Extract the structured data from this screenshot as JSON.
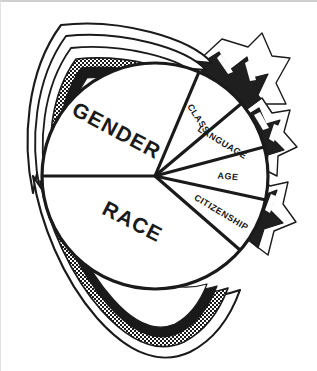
{
  "figure": {
    "name": "identity-wheel-lotus-diagram",
    "type": "segmented-circle",
    "background_color": "#ffffff",
    "ink_color": "#1a1a1a",
    "center": {
      "x": 155,
      "y": 176
    },
    "radius": 113
  },
  "segments": [
    {
      "id": "gender",
      "label": "GENDER",
      "size": "major",
      "start_angle": 180,
      "end_angle": 293,
      "label_angle": 228,
      "label_radius": 58,
      "label_rotation": 28,
      "petal": "layered-halftone-top-left"
    },
    {
      "id": "class",
      "label": "CLASS",
      "size": "minor",
      "start_angle": 293,
      "end_angle": 320,
      "label_angle": 306,
      "label_radius": 74,
      "label_rotation": 57,
      "petal": "dark-notched-upper-right"
    },
    {
      "id": "language",
      "label": "LANGUAGE",
      "size": "minor",
      "start_angle": 320,
      "end_angle": 345,
      "label_angle": 332,
      "label_radius": 76,
      "label_rotation": 31,
      "petal": "dark-notched-right-upper"
    },
    {
      "id": "age",
      "label": "AGE",
      "size": "minor",
      "start_angle": 345,
      "end_angle": 12,
      "label_angle": 358,
      "label_radius": 75,
      "label_rotation": 5,
      "petal": "dark-notched-right-lower"
    },
    {
      "id": "citizenship",
      "label": "CITIZENSHIP",
      "size": "minor",
      "start_angle": 12,
      "end_angle": 41,
      "label_angle": 26,
      "label_radius": 76,
      "label_rotation": -31,
      "petal": "dark-notched-lower-right"
    },
    {
      "id": "race",
      "label": "RACE",
      "size": "major",
      "start_angle": 41,
      "end_angle": 180,
      "label_angle": 112,
      "label_radius": 62,
      "label_rotation": -27,
      "petal": "layered-halftone-bottom-left"
    }
  ],
  "petals": {
    "halftone_fill_color": "#1a1a1a",
    "solid_fill_color": "#1f1f1f",
    "outline_color": "#1a1a1a",
    "highlight_color": "#ffffff"
  }
}
